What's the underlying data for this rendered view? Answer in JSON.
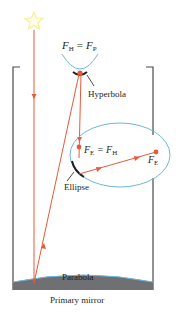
{
  "labels": {
    "hyperbola_focus_main": "F",
    "hyperbola_focus_sub": "H",
    "equals": "=",
    "primary_focus_main": "F",
    "primary_focus_sub": "P",
    "hyperbola": "Hyperbola",
    "ellipse_focus_main": "F",
    "ellipse_focus_sub": "E",
    "ellipse_eq_main": "F",
    "ellipse_eq_sub": "H",
    "ellipse_far_focus_main": "F",
    "ellipse_far_focus_sub": "E",
    "ellipse": "Ellipse",
    "parabola": "Parabola",
    "primary_mirror": "Primary mirror"
  },
  "colors": {
    "ray": "#e8583a",
    "focus_dot": "#e8583a",
    "conic_curve": "#6fb6d9",
    "mirror": "#231f20",
    "tube": "#4a4a4a",
    "star": "#f6ee9a",
    "primary_mirror_fill": "#6e7073"
  },
  "icons": {
    "star": "star-icon"
  }
}
